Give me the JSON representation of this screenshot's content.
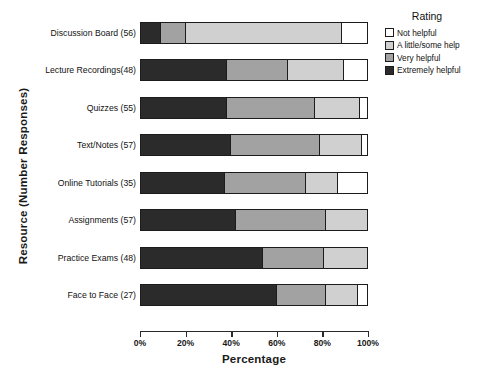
{
  "chart_data": {
    "type": "bar",
    "orientation": "horizontal",
    "stacked": true,
    "stacked_mode": "percent",
    "title": "",
    "xlabel": "Percentage",
    "ylabel": "Resource (Number Responses)",
    "xlim": [
      0,
      100
    ],
    "xticks": [
      0,
      20,
      40,
      60,
      80,
      100
    ],
    "xtick_labels": [
      "0%",
      "20%",
      "40%",
      "60%",
      "80%",
      "100%"
    ],
    "grid": false,
    "legend": {
      "title": "Rating",
      "position": "right-top",
      "entries": [
        {
          "label": "Not helpful",
          "color": "#ffffff"
        },
        {
          "label": "A little/some help",
          "color": "#d0d0d0"
        },
        {
          "label": "Very helpful",
          "color": "#a2a2a2"
        },
        {
          "label": "Extremely helpful",
          "color": "#2b2b2b"
        }
      ]
    },
    "categories": [
      "Discussion Board (56)",
      "Lecture Recordings(48)",
      "Quizzes (55)",
      "Text/Notes (57)",
      "Online Tutorials (35)",
      "Assignments (57)",
      "Practice Exams (48)",
      "Face to Face (27)"
    ],
    "series": [
      {
        "name": "Extremely helpful",
        "color": "#2b2b2b",
        "values": [
          9,
          38,
          38,
          40,
          37,
          42,
          54,
          60
        ]
      },
      {
        "name": "Very helpful",
        "color": "#a2a2a2",
        "values": [
          11,
          27,
          39,
          39,
          36,
          40,
          27,
          22
        ]
      },
      {
        "name": "A little/some help",
        "color": "#d0d0d0",
        "values": [
          69,
          25,
          20,
          19,
          14,
          18,
          19,
          14
        ]
      },
      {
        "name": "Not helpful",
        "color": "#ffffff",
        "values": [
          11,
          10,
          3,
          2,
          13,
          0,
          0,
          4
        ]
      }
    ]
  }
}
